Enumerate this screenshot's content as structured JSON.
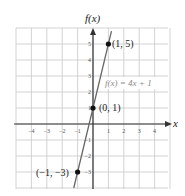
{
  "chart_data": {
    "type": "line",
    "title": "",
    "xlabel": "x",
    "ylabel": "f(x)",
    "xlim": [
      -5,
      5
    ],
    "ylim": [
      -4,
      6
    ],
    "grid": true,
    "x_ticks": [
      -4,
      -3,
      -2,
      -1,
      1,
      2,
      3,
      4
    ],
    "y_ticks": [
      -3,
      -2,
      -1,
      1,
      2,
      3,
      4,
      5
    ],
    "series": [
      {
        "name": "f(x) = 4x + 1",
        "equation": "f(x) = 4x + 1",
        "slope": 4,
        "intercept": 1,
        "x": [
          -1.25,
          1.2
        ],
        "y": [
          -4,
          5.8
        ]
      }
    ],
    "points": [
      {
        "x": 1,
        "y": 5,
        "label": "(1, 5)"
      },
      {
        "x": 0,
        "y": 1,
        "label": "(0, 1)"
      },
      {
        "x": -1,
        "y": -3,
        "label": "(−1, −3)"
      }
    ],
    "annotations": [
      {
        "text": "f(x) = 4x + 1",
        "x": 1.2,
        "y": 2.4
      }
    ]
  },
  "labels": {
    "y_axis": "f(x)",
    "x_axis": "x",
    "function": "f(x) = 4x + 1",
    "p1": "(1, 5)",
    "p2": "(0, 1)",
    "p3": "(−1, −3)"
  }
}
